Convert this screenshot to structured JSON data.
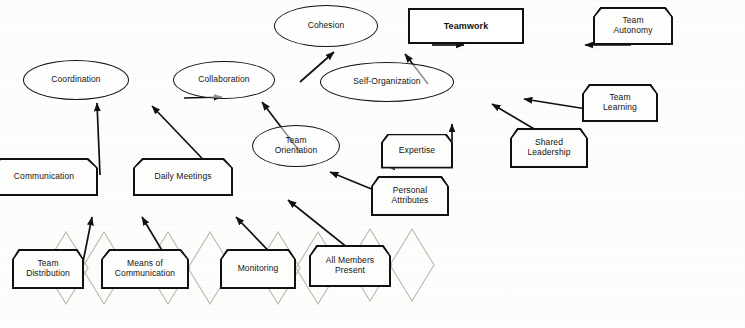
{
  "diagram": {
    "background_color": "#fdfdfc",
    "line_color": "#121110",
    "watermark_color": "#b9b7b0",
    "nodes": [
      {
        "id": "cohesion",
        "label": "Cohesion",
        "shape": "ellipse",
        "x": 326,
        "y": 26,
        "w": 104,
        "h": 42
      },
      {
        "id": "teamwork",
        "label": "Teamwork",
        "shape": "rect",
        "x": 466,
        "y": 26,
        "w": 116,
        "h": 36
      },
      {
        "id": "team-autonomy",
        "label": "Team\nAutonomy",
        "shape": "tagbox",
        "x": 633,
        "y": 26,
        "w": 80,
        "h": 38
      },
      {
        "id": "coordination",
        "label": "Coordination",
        "shape": "ellipse",
        "x": 76,
        "y": 80,
        "w": 106,
        "h": 40
      },
      {
        "id": "collaboration",
        "label": "Collaboration",
        "shape": "ellipse",
        "x": 224,
        "y": 80,
        "w": 102,
        "h": 38
      },
      {
        "id": "self-organization",
        "label": "Self-Organization",
        "shape": "ellipse",
        "x": 387,
        "y": 82,
        "w": 134,
        "h": 40
      },
      {
        "id": "team-learning",
        "label": "Team\nLearning",
        "shape": "tagbox",
        "x": 620,
        "y": 103,
        "w": 76,
        "h": 38
      },
      {
        "id": "shared-leadership",
        "label": "Shared\nLeadership",
        "shape": "tagbox",
        "x": 549,
        "y": 148,
        "w": 78,
        "h": 40
      },
      {
        "id": "team-orientation",
        "label": "Team\nOrientation",
        "shape": "ellipse",
        "x": 296,
        "y": 146,
        "w": 88,
        "h": 42
      },
      {
        "id": "expertise",
        "label": "Expertise",
        "shape": "tagbox",
        "x": 417,
        "y": 151,
        "w": 72,
        "h": 35
      },
      {
        "id": "personal-attributes",
        "label": "Personal\nAttributes",
        "shape": "tagbox",
        "x": 410,
        "y": 196,
        "w": 78,
        "h": 40
      },
      {
        "id": "communication",
        "label": "Communication",
        "shape": "tagbox",
        "x": 44,
        "y": 177,
        "w": 108,
        "h": 38
      },
      {
        "id": "daily-meetings",
        "label": "Daily Meetings",
        "shape": "tagbox",
        "x": 183,
        "y": 177,
        "w": 100,
        "h": 38
      },
      {
        "id": "team-distribution",
        "label": "Team\nDistribution",
        "shape": "tagbox",
        "x": 48,
        "y": 269,
        "w": 72,
        "h": 40
      },
      {
        "id": "means-of-communication",
        "label": "Means of\nCommunication",
        "shape": "tagbox",
        "x": 145,
        "y": 269,
        "w": 88,
        "h": 40
      },
      {
        "id": "monitoring",
        "label": "Monitoring",
        "shape": "tagbox",
        "x": 258,
        "y": 269,
        "w": 76,
        "h": 40
      },
      {
        "id": "all-members-present",
        "label": "All Members\nPresent",
        "shape": "tagbox",
        "x": 350,
        "y": 266,
        "w": 82,
        "h": 42
      }
    ],
    "edges": [
      {
        "id": "edge-collaboration-cohesion",
        "from": "Collaboration",
        "to": "Cohesion",
        "x1": 300,
        "y1": 82,
        "x2": 334,
        "y2": 52
      },
      {
        "id": "edge-cohesion-teamwork",
        "from": "Cohesion",
        "to": "Teamwork",
        "x1": 432,
        "y1": 45,
        "x2": 464,
        "y2": 45
      },
      {
        "id": "edge-team-autonomy-teamwork",
        "from": "Team Autonomy",
        "to": "Teamwork",
        "x1": 631,
        "y1": 45,
        "x2": 585,
        "y2": 45
      },
      {
        "id": "edge-self-organization-cohesion",
        "from": "Self-Organization",
        "to": "Cohesion",
        "x1": 428,
        "y1": 84,
        "x2": 405,
        "y2": 54
      },
      {
        "id": "edge-coordination-collaboration",
        "from": "Coordination",
        "to": "Collaboration",
        "x1": 184,
        "y1": 98,
        "x2": 222,
        "y2": 97
      },
      {
        "id": "edge-team-learning-self-org",
        "from": "Team Learning",
        "to": "Self-Organization",
        "x1": 618,
        "y1": 114,
        "x2": 524,
        "y2": 99
      },
      {
        "id": "edge-shared-leadership-self-org",
        "from": "Shared Leadership",
        "to": "Self-Organization",
        "x1": 563,
        "y1": 146,
        "x2": 492,
        "y2": 104
      },
      {
        "id": "edge-expertise-self-org",
        "from": "Expertise",
        "to": "Self-Organization",
        "x1": 452,
        "y1": 149,
        "x2": 452,
        "y2": 124
      },
      {
        "id": "edge-expertise-team-orientation",
        "from": "Expertise",
        "to": "Team Orientation",
        "x1": 415,
        "y1": 167,
        "x2": 387,
        "y2": 167
      },
      {
        "id": "edge-personal-attr-team-orient",
        "from": "Personal Attributes",
        "to": "Team Orientation",
        "x1": 408,
        "y1": 204,
        "x2": 330,
        "y2": 172
      },
      {
        "id": "edge-team-orientation-collab",
        "from": "Team Orientation",
        "to": "Collaboration",
        "x1": 300,
        "y1": 152,
        "x2": 262,
        "y2": 102
      },
      {
        "id": "edge-communication-coordination",
        "from": "Communication",
        "to": "Coordination",
        "x1": 100,
        "y1": 175,
        "x2": 97,
        "y2": 103
      },
      {
        "id": "edge-daily-meetings-coordination",
        "from": "Daily Meetings",
        "to": "Coordination",
        "x1": 218,
        "y1": 175,
        "x2": 152,
        "y2": 106
      },
      {
        "id": "edge-team-distribution-comm",
        "from": "Team Distribution",
        "to": "Communication",
        "x1": 82,
        "y1": 267,
        "x2": 92,
        "y2": 217
      },
      {
        "id": "edge-means-of-comm-comm",
        "from": "Means of Communication",
        "to": "Communication",
        "x1": 172,
        "y1": 267,
        "x2": 142,
        "y2": 217
      },
      {
        "id": "edge-monitoring-daily-meetings",
        "from": "Monitoring",
        "to": "Daily Meetings",
        "x1": 284,
        "y1": 267,
        "x2": 236,
        "y2": 217
      },
      {
        "id": "edge-all-members-daily-meetings",
        "from": "All Members Present",
        "to": "Daily Meetings",
        "x1": 368,
        "y1": 264,
        "x2": 288,
        "y2": 200
      }
    ],
    "watermarks": [
      {
        "id": "wm-team-distribution-left",
        "cx": 66,
        "cy": 268,
        "rx": 22,
        "ry": 36
      },
      {
        "id": "wm-team-distribution-right",
        "cx": 104,
        "cy": 268,
        "rx": 22,
        "ry": 36
      },
      {
        "id": "wm-means-left",
        "cx": 168,
        "cy": 268,
        "rx": 22,
        "ry": 36
      },
      {
        "id": "wm-means-right",
        "cx": 210,
        "cy": 268,
        "rx": 22,
        "ry": 36
      },
      {
        "id": "wm-monitoring-left",
        "cx": 278,
        "cy": 268,
        "rx": 22,
        "ry": 36
      },
      {
        "id": "wm-monitoring-right",
        "cx": 318,
        "cy": 268,
        "rx": 22,
        "ry": 36
      },
      {
        "id": "wm-all-members-left",
        "cx": 370,
        "cy": 265,
        "rx": 22,
        "ry": 36
      },
      {
        "id": "wm-all-members-right",
        "cx": 412,
        "cy": 265,
        "rx": 22,
        "ry": 36
      }
    ]
  }
}
